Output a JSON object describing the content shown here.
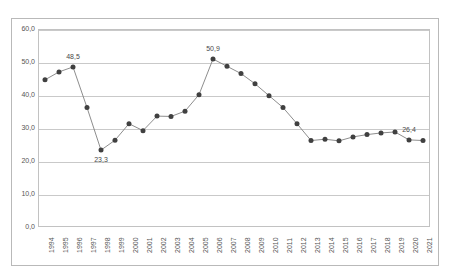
{
  "chart_data": {
    "type": "line",
    "title": "",
    "subtitle": "",
    "xlabel": "",
    "ylabel": "",
    "ylim": [
      0.0,
      60.0
    ],
    "yticks": [
      "0,0",
      "10,0",
      "20,0",
      "30,0",
      "40,0",
      "50,0",
      "60,0"
    ],
    "ytick_values": [
      0.0,
      10.0,
      20.0,
      30.0,
      40.0,
      50.0,
      60.0
    ],
    "grid": true,
    "legend": false,
    "legend_position": "none",
    "decimal_separator": ",",
    "marker": "filled-circle",
    "line_color": "#808080",
    "marker_color": "#404040",
    "categories": [
      "1994",
      "1995",
      "1996",
      "1997",
      "1998",
      "1999",
      "2000",
      "2001",
      "2002",
      "2003",
      "2004",
      "2005",
      "2006",
      "2007",
      "2008",
      "2009",
      "2010",
      "2011",
      "2012",
      "2013",
      "2014",
      "2015",
      "2016",
      "2017",
      "2018",
      "2019",
      "2020",
      "2021"
    ],
    "values": [
      44.6,
      47.0,
      48.5,
      36.2,
      23.3,
      26.3,
      31.3,
      29.2,
      33.6,
      33.5,
      35.1,
      40.1,
      50.9,
      48.7,
      46.5,
      43.4,
      39.8,
      36.2,
      31.3,
      26.2,
      26.6,
      26.1,
      27.3,
      28.0,
      28.5,
      28.8,
      26.4,
      26.2
    ],
    "annotations": [
      {
        "category": "1996",
        "value": 48.5,
        "text": "48,5",
        "position": "above"
      },
      {
        "category": "1998",
        "value": 23.3,
        "text": "23,3",
        "position": "below"
      },
      {
        "category": "2006",
        "value": 50.9,
        "text": "50,9",
        "position": "above"
      },
      {
        "category": "2020",
        "value": 26.4,
        "text": "26,4",
        "position": "above"
      }
    ]
  }
}
